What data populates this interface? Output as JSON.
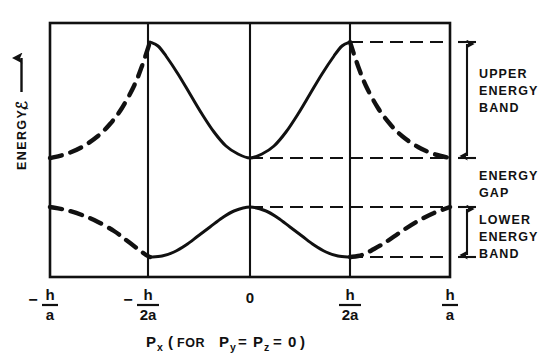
{
  "figure": {
    "title_implicit": "Energy band structure E vs p_x",
    "background_color": "#ffffff",
    "ink_color": "#111111"
  },
  "axes": {
    "y_label_text": "ENERGY,",
    "y_label_symbol": "ℰ",
    "y_label_arrow": "⟶",
    "x_caption": {
      "symbol": "P",
      "symbol_sub": "x",
      "paren_open": "(",
      "for_word": "FOR",
      "py": "P",
      "py_sub": "y",
      "eq1": "=",
      "pz": "P",
      "pz_sub": "z",
      "eq2": "=",
      "zero": "0",
      "paren_close": ")",
      "full_text": "Pₓ (FOR Pᵧ = Pᴢ = 0)"
    },
    "x_ticks": [
      {
        "sign": "−",
        "numerator": "h",
        "denominator": "a",
        "value": -1.0,
        "px": 50
      },
      {
        "sign": "−",
        "numerator": "h",
        "denominator": "2a",
        "value": -0.5,
        "px": 148
      },
      {
        "sign": "",
        "numerator": "0",
        "denominator": "",
        "value": 0.0,
        "px": 250
      },
      {
        "sign": "",
        "numerator": "h",
        "denominator": "2a",
        "value": 0.5,
        "px": 350
      },
      {
        "sign": "",
        "numerator": "h",
        "denominator": "a",
        "value": 1.0,
        "px": 450
      }
    ]
  },
  "annotations": [
    {
      "id": "upper-energy-band",
      "lines": [
        "UPPER",
        "ENERGY",
        "BAND"
      ],
      "has_arrow": true,
      "arrow_top_px": 42,
      "arrow_bottom_px": 158
    },
    {
      "id": "energy-gap",
      "lines": [
        "ENERGY",
        "GAP"
      ],
      "has_arrow": false,
      "arrow_top_px": 158,
      "arrow_bottom_px": 207
    },
    {
      "id": "lower-energy-band",
      "lines": [
        "LOWER",
        "ENERGY",
        "BAND"
      ],
      "has_arrow": true,
      "arrow_top_px": 207,
      "arrow_bottom_px": 257
    }
  ],
  "chart_data": {
    "type": "line",
    "title": "",
    "xlabel": "P_x (FOR P_y = P_z = 0)",
    "ylabel": "ENERGY, E",
    "xlim": [
      -1.0,
      1.0
    ],
    "ylim": [
      0,
      1
    ],
    "grid": false,
    "vertical_gridlines_at": [
      -0.5,
      0.0,
      0.5
    ],
    "zone_boundaries": [
      -0.5,
      0.5
    ],
    "legend": "none",
    "level_lines": [
      {
        "name": "upper-band-top",
        "y_px": 42,
        "from_x_px": 350,
        "to_x_px": 450,
        "style": "dashed"
      },
      {
        "name": "upper-band-bottom",
        "y_px": 158,
        "from_x_px": 250,
        "to_x_px": 450,
        "style": "dashed"
      },
      {
        "name": "lower-band-top",
        "y_px": 207,
        "from_x_px": 250,
        "to_x_px": 450,
        "style": "dashed"
      },
      {
        "name": "lower-band-bottom",
        "y_px": 257,
        "from_x_px": 350,
        "to_x_px": 450,
        "style": "dashed"
      }
    ],
    "series": [
      {
        "name": "upper energy band",
        "note": "maxima at +/- h/2a, minimum at p=0, solid inside first zone, dashed outside",
        "points": [
          {
            "x": -1.0,
            "y_px": 158
          },
          {
            "x": -0.92,
            "y_px": 154
          },
          {
            "x": -0.84,
            "y_px": 147
          },
          {
            "x": -0.76,
            "y_px": 136
          },
          {
            "x": -0.7,
            "y_px": 124
          },
          {
            "x": -0.64,
            "y_px": 108
          },
          {
            "x": -0.58,
            "y_px": 86
          },
          {
            "x": -0.54,
            "y_px": 66
          },
          {
            "x": -0.5,
            "y_px": 42
          },
          {
            "x": -0.46,
            "y_px": 46
          },
          {
            "x": -0.42,
            "y_px": 56
          },
          {
            "x": -0.36,
            "y_px": 74
          },
          {
            "x": -0.3,
            "y_px": 94
          },
          {
            "x": -0.24,
            "y_px": 114
          },
          {
            "x": -0.18,
            "y_px": 132
          },
          {
            "x": -0.12,
            "y_px": 146
          },
          {
            "x": -0.06,
            "y_px": 154
          },
          {
            "x": 0.0,
            "y_px": 158
          },
          {
            "x": 0.06,
            "y_px": 154
          },
          {
            "x": 0.12,
            "y_px": 146
          },
          {
            "x": 0.18,
            "y_px": 132
          },
          {
            "x": 0.24,
            "y_px": 114
          },
          {
            "x": 0.3,
            "y_px": 94
          },
          {
            "x": 0.36,
            "y_px": 74
          },
          {
            "x": 0.42,
            "y_px": 56
          },
          {
            "x": 0.46,
            "y_px": 46
          },
          {
            "x": 0.5,
            "y_px": 42
          },
          {
            "x": 0.54,
            "y_px": 66
          },
          {
            "x": 0.58,
            "y_px": 86
          },
          {
            "x": 0.64,
            "y_px": 108
          },
          {
            "x": 0.7,
            "y_px": 124
          },
          {
            "x": 0.76,
            "y_px": 136
          },
          {
            "x": 0.84,
            "y_px": 147
          },
          {
            "x": 0.92,
            "y_px": 154
          },
          {
            "x": 1.0,
            "y_px": 158
          }
        ],
        "solid_range": [
          -0.5,
          0.5
        ]
      },
      {
        "name": "lower energy band",
        "note": "maximum at p=0, minima at +/- h/2a, solid inside first zone, dashed outside",
        "points": [
          {
            "x": -1.0,
            "y_px": 207
          },
          {
            "x": -0.92,
            "y_px": 210
          },
          {
            "x": -0.84,
            "y_px": 215
          },
          {
            "x": -0.76,
            "y_px": 222
          },
          {
            "x": -0.68,
            "y_px": 231
          },
          {
            "x": -0.62,
            "y_px": 240
          },
          {
            "x": -0.56,
            "y_px": 249
          },
          {
            "x": -0.52,
            "y_px": 255
          },
          {
            "x": -0.5,
            "y_px": 257
          },
          {
            "x": -0.44,
            "y_px": 256
          },
          {
            "x": -0.38,
            "y_px": 252
          },
          {
            "x": -0.32,
            "y_px": 245
          },
          {
            "x": -0.26,
            "y_px": 236
          },
          {
            "x": -0.2,
            "y_px": 227
          },
          {
            "x": -0.14,
            "y_px": 218
          },
          {
            "x": -0.08,
            "y_px": 211
          },
          {
            "x": 0.0,
            "y_px": 207
          },
          {
            "x": 0.08,
            "y_px": 211
          },
          {
            "x": 0.14,
            "y_px": 218
          },
          {
            "x": 0.2,
            "y_px": 227
          },
          {
            "x": 0.26,
            "y_px": 236
          },
          {
            "x": 0.32,
            "y_px": 245
          },
          {
            "x": 0.38,
            "y_px": 252
          },
          {
            "x": 0.44,
            "y_px": 256
          },
          {
            "x": 0.5,
            "y_px": 257
          },
          {
            "x": 0.56,
            "y_px": 255
          },
          {
            "x": 0.62,
            "y_px": 249
          },
          {
            "x": 0.68,
            "y_px": 242
          },
          {
            "x": 0.76,
            "y_px": 231
          },
          {
            "x": 0.84,
            "y_px": 221
          },
          {
            "x": 0.92,
            "y_px": 213
          },
          {
            "x": 1.0,
            "y_px": 207
          }
        ],
        "solid_range": [
          -0.5,
          0.5
        ]
      }
    ]
  }
}
